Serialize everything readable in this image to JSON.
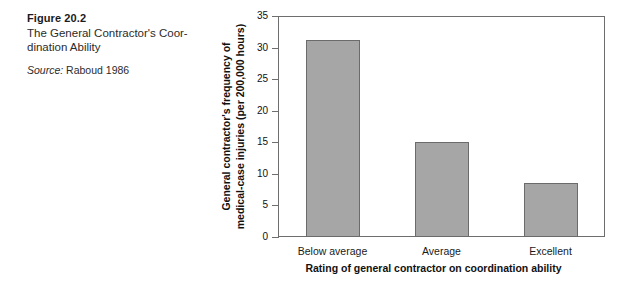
{
  "caption": {
    "figure_number": "Figure 20.2",
    "title": "The General Contractor's Coor-dination Ability",
    "title_line_1": "The General Contractor's Coor-",
    "title_line_2": "dination Ability",
    "source_label": "Source:",
    "source_value": "Raboud 1986"
  },
  "chart_data": {
    "type": "bar",
    "title": "",
    "categories": [
      "Below average",
      "Average",
      "Excellent"
    ],
    "values": [
      31.2,
      15.0,
      8.6
    ],
    "series": [
      {
        "name": "General contractor's frequency of medical-case injuries (per 200,000 hours)",
        "values": [
          31.2,
          15.0,
          8.6
        ]
      }
    ],
    "xlabel": "Rating of general contractor on coordination ability",
    "ylabel": "General contractor's frequency of medical-case injuries (per 200,000 hours)",
    "ylabel_line_1": "General contractor's frequency of",
    "ylabel_line_2": "medical-case injuries (per 200,000 hours)",
    "ylim": [
      0,
      35
    ],
    "yticks": [
      0,
      5,
      10,
      15,
      20,
      25,
      30,
      35
    ],
    "ytick_labels": [
      "0",
      "5",
      "10",
      "15",
      "20",
      "25",
      "30",
      "35"
    ],
    "grid": false,
    "legend": false,
    "bar_color": "#a6a6a6",
    "bar_edge_color": "#6b6b6b",
    "axis_color": "#6e6e6e"
  }
}
